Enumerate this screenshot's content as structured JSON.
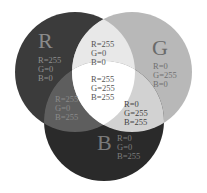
{
  "diagram": {
    "circles": [
      {
        "id": "R",
        "letter": "R",
        "values": [
          "R=255",
          "G=0",
          "B=0"
        ],
        "fill": "#3b3b3b",
        "letter_color": "#8a8a8a",
        "text_color": "#8f8f8f"
      },
      {
        "id": "G",
        "letter": "G",
        "values": [
          "R=0",
          "G=255",
          "B=0"
        ],
        "fill": "#b8b8b8",
        "letter_color": "#6a6a6a",
        "text_color": "#707070"
      },
      {
        "id": "B",
        "letter": "B",
        "values": [
          "R=0",
          "G=0",
          "B=255"
        ],
        "fill": "#2a2a2a",
        "letter_color": "#7a7a7a",
        "text_color": "#7d7d7d"
      }
    ],
    "overlaps": [
      {
        "id": "RG",
        "values": [
          "R=255",
          "G=0",
          "B=0"
        ],
        "fill": "#e8e8e8",
        "text_color": "#555555"
      },
      {
        "id": "RB",
        "values": [
          "R=255",
          "G=0",
          "B=255"
        ],
        "fill": "#5e5e5e",
        "text_color": "#8a8a8a"
      },
      {
        "id": "GB",
        "values": [
          "R=0",
          "G=255",
          "B=255"
        ],
        "fill": "#d2d2d2",
        "text_color": "#444444"
      },
      {
        "id": "RGB",
        "values": [
          "R=255",
          "G=255",
          "B=255"
        ],
        "fill": "#ffffff",
        "text_color": "#555555"
      }
    ]
  }
}
